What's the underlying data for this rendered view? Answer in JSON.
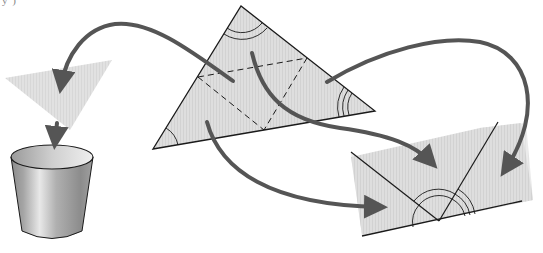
{
  "diagram": {
    "caption_remnant": "y                       )",
    "colors": {
      "paper_fill": "#dcdcdc",
      "outline": "#1a1a1a",
      "arrow": "#555555",
      "bucket_light": "#e6e6e6",
      "bucket_dark": "#7a7a7a",
      "background": "#ffffff"
    },
    "main_triangle": {
      "vertices": [
        [
          153,
          149
        ],
        [
          241,
          6
        ],
        [
          375,
          111
        ]
      ],
      "midlines_dashed": [
        [
          [
            198,
            77
          ],
          [
            307,
            58
          ]
        ],
        [
          [
            198,
            77
          ],
          [
            264,
            130
          ]
        ],
        [
          [
            307,
            58
          ],
          [
            264,
            130
          ]
        ]
      ],
      "angle_marks": {
        "left": 1,
        "top": 2,
        "right": 3
      }
    },
    "scrap_triangle": {
      "vertices": [
        [
          5,
          78
        ],
        [
          112,
          60
        ],
        [
          70,
          130
        ]
      ]
    },
    "bucket": {
      "label": "waste-bin",
      "rim_center": [
        52,
        157
      ],
      "rim_rx": 41,
      "rim_ry": 12,
      "bottom_y": 238
    },
    "rearranged_figure": {
      "straight_line_point": [
        439,
        221
      ],
      "angle_marks": {
        "left": 1,
        "middle": 2,
        "right": 3
      }
    },
    "arrows": [
      {
        "name": "scrap-to-left",
        "from": [
          233,
          81
        ],
        "to": [
          61,
          95
        ]
      },
      {
        "name": "scrap-to-bin",
        "from": [
          56,
          122
        ],
        "to": [
          54,
          150
        ]
      },
      {
        "name": "top-angle-to-line",
        "from": [
          252,
          53
        ],
        "to": [
          435,
          170
        ]
      },
      {
        "name": "right-angle-to-line",
        "from": [
          327,
          82
        ],
        "to": [
          496,
          180
        ]
      },
      {
        "name": "left-angle-to-line",
        "from": [
          206,
          122
        ],
        "to": [
          402,
          206
        ]
      }
    ]
  }
}
